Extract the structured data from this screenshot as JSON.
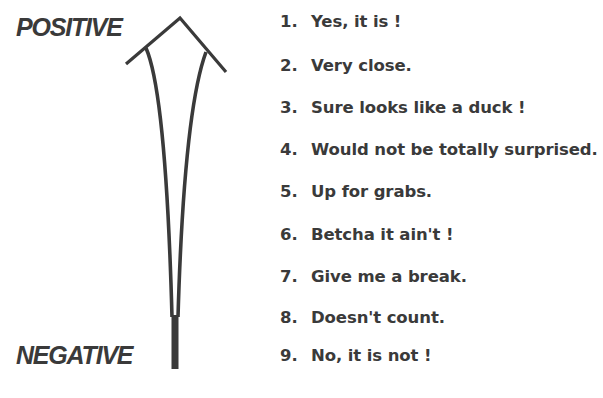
{
  "diagram": {
    "type": "likelihood-scale",
    "top_label": "POSITIVE",
    "bottom_label": "NEGATIVE",
    "arrow_direction": "up",
    "colors": {
      "ink": "#3a3a3a",
      "background": "#ffffff"
    },
    "items": [
      {
        "number": "1.",
        "text": "Yes, it is !"
      },
      {
        "number": "2.",
        "text": "Very close."
      },
      {
        "number": "3.",
        "text": "Sure looks like a duck !"
      },
      {
        "number": "4.",
        "text": "Would not be totally surprised."
      },
      {
        "number": "5.",
        "text": "Up for grabs."
      },
      {
        "number": "6.",
        "text": "Betcha it ain't !"
      },
      {
        "number": "7.",
        "text": "Give me a break."
      },
      {
        "number": "8.",
        "text": "Doesn't count."
      },
      {
        "number": "9.",
        "text": "No, it is not !"
      }
    ]
  }
}
